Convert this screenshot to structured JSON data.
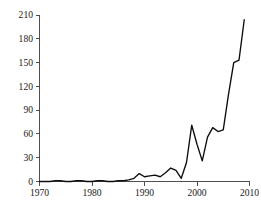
{
  "chart_data": {
    "type": "line",
    "title": "",
    "subtitle": "",
    "xlabel": "",
    "ylabel": "",
    "xlim": [
      1970,
      2010
    ],
    "ylim": [
      0,
      210
    ],
    "grid": false,
    "legend": null,
    "legend_position": "none",
    "line_color": "#0d0d0d",
    "background_color": "#ffffff",
    "axis_color": "#3d3d3d",
    "xticks": [
      1970,
      1980,
      1990,
      2000,
      2010
    ],
    "xtick_labels": [
      "1970",
      "1980",
      "1990",
      "2000",
      "2010"
    ],
    "yticks": [
      0,
      30,
      60,
      90,
      120,
      150,
      180,
      210
    ],
    "ytick_labels": [
      "0",
      "30",
      "60",
      "90",
      "120",
      "150",
      "180",
      "210"
    ],
    "series": [
      {
        "name": "",
        "x": [
          1970,
          1971,
          1972,
          1973,
          1974,
          1975,
          1976,
          1977,
          1978,
          1979,
          1980,
          1981,
          1982,
          1983,
          1984,
          1985,
          1986,
          1987,
          1988,
          1989,
          1990,
          1991,
          1992,
          1993,
          1994,
          1995,
          1996,
          1997,
          1998,
          1999,
          2000,
          2001,
          2002,
          2003,
          2004,
          2005,
          2006,
          2007,
          2008,
          2009
        ],
        "values": [
          0,
          0,
          0,
          1,
          1,
          0,
          0,
          1,
          1,
          0,
          0,
          1,
          1,
          0,
          0,
          1,
          1,
          2,
          4,
          10,
          6,
          7,
          8,
          6,
          11,
          17,
          14,
          4,
          24,
          71,
          47,
          26,
          56,
          68,
          63,
          65,
          110,
          150,
          153,
          204
        ]
      }
    ]
  }
}
